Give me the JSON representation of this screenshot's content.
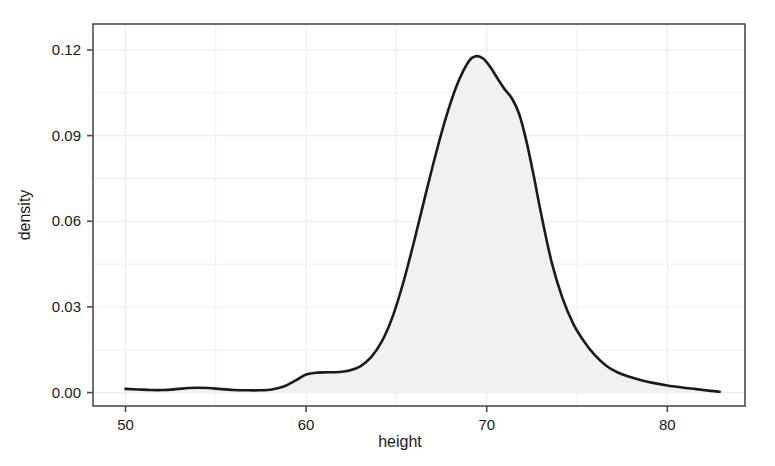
{
  "figure": {
    "background_color": "#ffffff",
    "plot_background_color": "#ffffff",
    "frame_color": "#4d4d4d",
    "gridline_color": "#ececec",
    "curve_color": "#1a1a1a",
    "fill_color": "#f1f1f1"
  },
  "axes": {
    "x": {
      "title": "height",
      "tick_labels": [
        "50",
        "60",
        "70",
        "80"
      ],
      "tick_values": [
        50,
        60,
        70,
        80
      ],
      "range": [
        48.2,
        84.3
      ]
    },
    "y": {
      "title": "density",
      "tick_labels": [
        "0.00",
        "0.03",
        "0.06",
        "0.09",
        "0.12"
      ],
      "tick_values": [
        0.0,
        0.03,
        0.06,
        0.09,
        0.12
      ],
      "range": [
        -0.0047,
        0.1291
      ]
    }
  },
  "chart_data": {
    "type": "area",
    "title": "",
    "xlabel": "height",
    "ylabel": "density",
    "xlim": [
      48.2,
      84.3
    ],
    "ylim": [
      -0.0047,
      0.1291
    ],
    "grid": true,
    "legend": null,
    "series": [
      {
        "name": "density",
        "fill": true,
        "x": [
          50.0,
          50.7,
          51.4,
          52.1,
          52.8,
          53.5,
          54.0,
          54.6,
          55.3,
          56.0,
          56.7,
          57.4,
          58.1,
          58.8,
          59.4,
          60.0,
          60.6,
          61.2,
          61.8,
          62.4,
          63.0,
          63.6,
          64.2,
          64.8,
          65.4,
          66.0,
          66.6,
          67.2,
          67.8,
          68.4,
          69.0,
          69.4,
          69.8,
          70.2,
          70.6,
          71.0,
          71.4,
          71.8,
          72.2,
          72.6,
          73.0,
          73.6,
          74.2,
          74.8,
          75.4,
          76.0,
          76.6,
          77.2,
          77.8,
          78.5,
          79.2,
          80.0,
          80.8,
          81.6,
          82.4,
          82.9
        ],
        "y": [
          0.0013,
          0.0011,
          0.0009,
          0.0009,
          0.0012,
          0.0016,
          0.0017,
          0.0016,
          0.0012,
          0.0009,
          0.0008,
          0.0008,
          0.0011,
          0.0022,
          0.0042,
          0.0063,
          0.007,
          0.0071,
          0.0072,
          0.0077,
          0.0092,
          0.0124,
          0.018,
          0.0268,
          0.039,
          0.0535,
          0.069,
          0.084,
          0.0975,
          0.1085,
          0.116,
          0.1178,
          0.117,
          0.114,
          0.11,
          0.1062,
          0.103,
          0.0975,
          0.088,
          0.076,
          0.063,
          0.0455,
          0.033,
          0.024,
          0.0178,
          0.013,
          0.0095,
          0.0072,
          0.0057,
          0.0044,
          0.0034,
          0.0025,
          0.0018,
          0.0012,
          0.0006,
          0.0003
        ]
      }
    ],
    "annotations": [
      {
        "label": "peak",
        "x": 69.4,
        "y": 0.1178
      },
      {
        "label": "shoulder",
        "x": 71.4,
        "y": 0.103
      },
      {
        "label": "left-bump",
        "x": 54.0,
        "y": 0.0017
      },
      {
        "label": "left-shoulder",
        "x": 61.2,
        "y": 0.0071
      }
    ]
  }
}
